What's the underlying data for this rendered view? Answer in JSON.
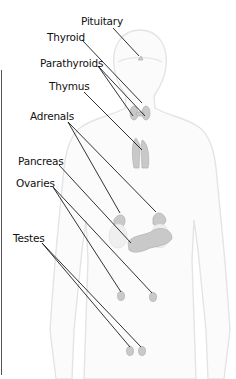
{
  "diagram": {
    "type": "anatomical-label-diagram",
    "labels": [
      {
        "id": "pituitary",
        "text": "Pituitary",
        "x": 81,
        "y": 15
      },
      {
        "id": "thyroid",
        "text": "Thyroid",
        "x": 47,
        "y": 31
      },
      {
        "id": "parathyroids",
        "text": "Parathyroids",
        "x": 40,
        "y": 57
      },
      {
        "id": "thymus",
        "text": "Thymus",
        "x": 49,
        "y": 80
      },
      {
        "id": "adrenals",
        "text": "Adrenals",
        "x": 30,
        "y": 110
      },
      {
        "id": "pancreas",
        "text": "Pancreas",
        "x": 18,
        "y": 155
      },
      {
        "id": "ovaries",
        "text": "Ovaries",
        "x": 16,
        "y": 177
      },
      {
        "id": "testes",
        "text": "Testes",
        "x": 13,
        "y": 232
      }
    ],
    "colors": {
      "background": "#ffffff",
      "leader_line": "#1a1a1a",
      "body_outline": "#e6e6e6",
      "gland_fill": "#c8c8c8",
      "label_text": "#111111"
    }
  }
}
